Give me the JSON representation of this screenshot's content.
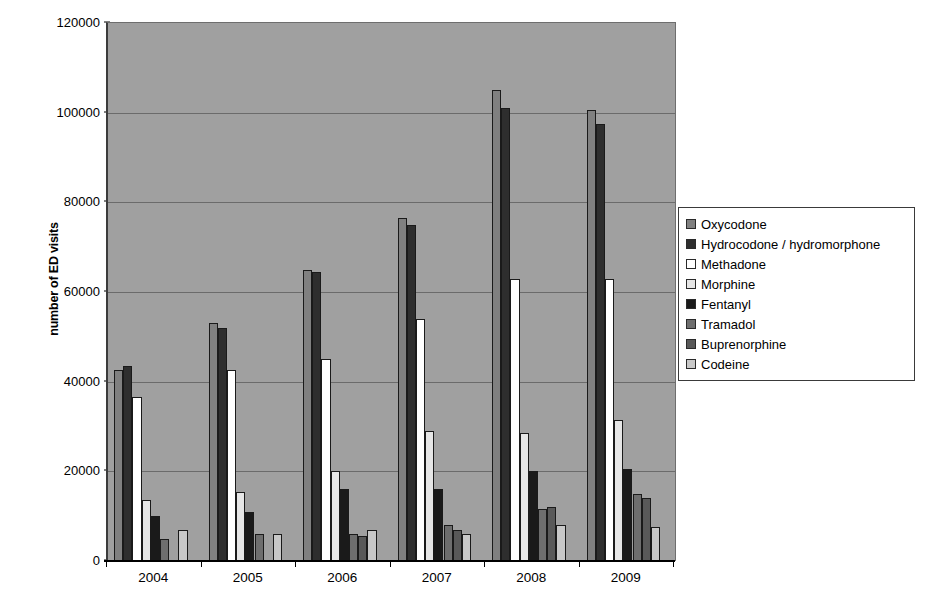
{
  "chart_data": {
    "type": "bar",
    "title": "",
    "subtitle": "",
    "xlabel": "",
    "ylabel": "number of ED visits",
    "ylim": [
      0,
      120000
    ],
    "ytick_labels": [
      "0",
      "20000",
      "40000",
      "60000",
      "80000",
      "100000",
      "120000"
    ],
    "ytick_values": [
      0,
      20000,
      40000,
      60000,
      80000,
      100000,
      120000
    ],
    "grid": true,
    "grid_axis": "y",
    "legend_position": "right",
    "plot_background": "#a0a0a0",
    "categories": [
      "2004",
      "2005",
      "2006",
      "2007",
      "2008",
      "2009"
    ],
    "series": [
      {
        "name": "Oxycodone",
        "color": "#808080",
        "values": [
          42500,
          53000,
          65000,
          76500,
          105000,
          100500
        ]
      },
      {
        "name": "Hydrocodone / hydromorphone",
        "color": "#2e2e2e",
        "values": [
          43500,
          52000,
          64500,
          75000,
          101000,
          97500
        ]
      },
      {
        "name": "Methadone",
        "color": "#ffffff",
        "values": [
          36500,
          42500,
          45000,
          54000,
          63000,
          63000
        ]
      },
      {
        "name": "Morphine",
        "color": "#e6e6e6",
        "values": [
          13500,
          15500,
          20000,
          29000,
          28500,
          31500
        ]
      },
      {
        "name": "Fentanyl",
        "color": "#1a1a1a",
        "values": [
          10000,
          11000,
          16000,
          16000,
          20000,
          20500
        ]
      },
      {
        "name": "Tramadol",
        "color": "#6e6e6e",
        "values": [
          5000,
          6000,
          6000,
          8000,
          11500,
          15000
        ]
      },
      {
        "name": "Buprenorphine",
        "color": "#595959",
        "values": [
          0,
          0,
          5500,
          7000,
          12000,
          14000
        ]
      },
      {
        "name": "Codeine",
        "color": "#c8c8c8",
        "values": [
          7000,
          6000,
          7000,
          6000,
          8000,
          7500
        ]
      }
    ]
  },
  "legend": {
    "items": [
      {
        "label": "Oxycodone",
        "color": "#808080"
      },
      {
        "label": "Hydrocodone / hydromorphone",
        "color": "#2e2e2e"
      },
      {
        "label": "Methadone",
        "color": "#ffffff"
      },
      {
        "label": "Morphine",
        "color": "#e6e6e6"
      },
      {
        "label": "Fentanyl",
        "color": "#1a1a1a"
      },
      {
        "label": "Tramadol",
        "color": "#6e6e6e"
      },
      {
        "label": "Buprenorphine",
        "color": "#595959"
      },
      {
        "label": "Codeine",
        "color": "#c8c8c8"
      }
    ]
  },
  "axes": {
    "y_title": "number of ED visits"
  }
}
